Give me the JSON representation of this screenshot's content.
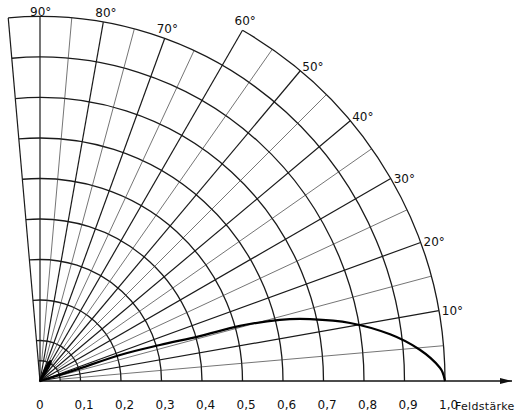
{
  "chart_data": {
    "type": "polar-line",
    "title": "",
    "xlabel": "Feldstärke",
    "radial_axis": {
      "label": "Feldstärke",
      "range": [
        0,
        1.0
      ],
      "ticks": [
        0,
        0.1,
        0.2,
        0.3,
        0.4,
        0.5,
        0.6,
        0.7,
        0.8,
        0.9,
        1.0
      ],
      "tick_labels": [
        "0",
        "0,1",
        "0,2",
        "0,3",
        "0,4",
        "0,5",
        "0,6",
        "0,7",
        "0,8",
        "0,9",
        "1,0"
      ],
      "extra_arc": 0.05
    },
    "angular_axis": {
      "range_deg": [
        0,
        95
      ],
      "grid_step_deg": 5,
      "major_step_deg": 10,
      "labels": [
        {
          "deg": 10,
          "text": "10°"
        },
        {
          "deg": 20,
          "text": "20°"
        },
        {
          "deg": 30,
          "text": "30°"
        },
        {
          "deg": 40,
          "text": "40°"
        },
        {
          "deg": 50,
          "text": "50°"
        },
        {
          "deg": 60,
          "text": "60°"
        },
        {
          "deg": 70,
          "text": "70°"
        },
        {
          "deg": 80,
          "text": "80°"
        },
        {
          "deg": 90,
          "text": "90°"
        }
      ],
      "outer_radius_note": "grid extends to 1.0 for 0°–60°, to 0.9 for 60°–95°"
    },
    "grid": true,
    "series": [
      {
        "name": "main lobe",
        "points": [
          {
            "deg": 0,
            "r": 1.0
          },
          {
            "deg": 1.9,
            "r": 0.988
          },
          {
            "deg": 4.7,
            "r": 0.941
          },
          {
            "deg": 7.6,
            "r": 0.872
          },
          {
            "deg": 10.6,
            "r": 0.779
          },
          {
            "deg": 12.9,
            "r": 0.684
          },
          {
            "deg": 14.3,
            "r": 0.611
          },
          {
            "deg": 15.4,
            "r": 0.512
          },
          {
            "deg": 15.7,
            "r": 0.41
          },
          {
            "deg": 16.7,
            "r": 0.309
          },
          {
            "deg": 18.0,
            "r": 0.208
          },
          {
            "deg": 17.4,
            "r": 0.09
          },
          {
            "deg": 0,
            "r": 0
          }
        ]
      },
      {
        "name": "side lobe",
        "points": [
          {
            "deg": 50,
            "r": 0
          },
          {
            "deg": 58,
            "r": 0.04
          },
          {
            "deg": 62,
            "r": 0.056
          },
          {
            "deg": 66,
            "r": 0.04
          },
          {
            "deg": 72,
            "r": 0
          }
        ]
      }
    ]
  },
  "layout": {
    "origin_x": 40,
    "origin_y": 381,
    "px_per_unit": 405
  }
}
